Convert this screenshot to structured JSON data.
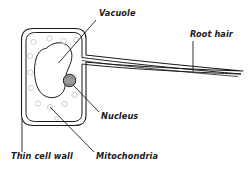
{
  "figure": {
    "kind": "biology-diagram",
    "background_color": "#ffffff",
    "ink_color": "#1b1b1b",
    "organelle_outline_color": "#cfcfcf",
    "nucleus_fill_color": "#9a9a9a"
  },
  "labels": {
    "vacuole": "Vacuole",
    "root_hair": "Root hair",
    "nucleus": "Nucleus",
    "mitochondria": "Mitochondria",
    "thin_cell_wall": "Thin cell wall"
  },
  "parts": [
    {
      "id": "cell-wall",
      "label": "Thin cell wall",
      "description": "double-line rounded rectangle forming the cell boundary"
    },
    {
      "id": "vacuole",
      "label": "Vacuole",
      "description": "large irregular blob filling the centre of the cell"
    },
    {
      "id": "nucleus",
      "label": "Nucleus",
      "description": "small shaded circle at the base of the root hair"
    },
    {
      "id": "mitochondria",
      "label": "Mitochondria",
      "description": "small pale circles scattered in the cytoplasm"
    },
    {
      "id": "root-hair",
      "label": "Root hair",
      "description": "long tapering tube extending to the right"
    }
  ]
}
